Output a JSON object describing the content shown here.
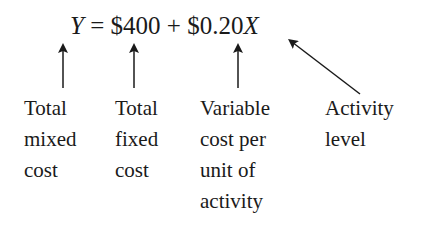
{
  "equation": {
    "lhs": "Y",
    "equals": "=",
    "fixed": "$400",
    "plus": "+",
    "rate": "$0.20",
    "activity_var": "X"
  },
  "labels": [
    {
      "lines": [
        "Total",
        "mixed",
        "cost"
      ]
    },
    {
      "lines": [
        "Total",
        "fixed",
        "cost"
      ]
    },
    {
      "lines": [
        "Variable",
        "cost per",
        "unit of",
        "activity"
      ]
    },
    {
      "lines": [
        "Activity",
        "level"
      ]
    }
  ]
}
